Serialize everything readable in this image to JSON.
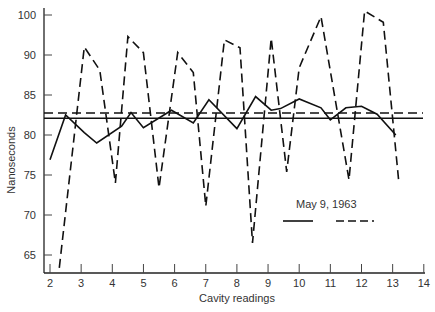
{
  "chart_data": {
    "type": "line",
    "title": "",
    "xlabel": "Cavity readings",
    "ylabel": "Nanoseconds",
    "xlim": [
      2,
      14
    ],
    "ylim": [
      62.5,
      97
    ],
    "grid": false,
    "x_ticks": [
      "2",
      "3",
      "4",
      "5",
      "6",
      "7",
      "8",
      "9",
      "10",
      "11",
      "12",
      "13",
      "14"
    ],
    "y_ticks": [
      {
        "label": "100",
        "pos": 95
      },
      {
        "label": "90",
        "pos": 90
      },
      {
        "label": "85",
        "pos": 85
      },
      {
        "label": "80",
        "pos": 80
      },
      {
        "label": "75",
        "pos": 75
      },
      {
        "label": "70",
        "pos": 70
      },
      {
        "label": "65",
        "pos": 65
      }
    ],
    "legend": {
      "title": "May 9, 1963",
      "position": "lower right",
      "entries": [
        {
          "name": "solid",
          "style": "solid"
        },
        {
          "name": "dashed",
          "style": "dashed"
        }
      ]
    },
    "series": [
      {
        "name": "solid",
        "style": "solid",
        "x": [
          2.0,
          2.5,
          3.1,
          3.5,
          4.3,
          4.6,
          5.0,
          5.9,
          6.6,
          7.1,
          8.0,
          8.6,
          9.1,
          9.4,
          10.0,
          10.7,
          11.0,
          11.5,
          12.0,
          12.5,
          13.1
        ],
        "y": [
          76.9,
          82.5,
          80.3,
          79.0,
          81.1,
          82.8,
          80.9,
          83.1,
          81.5,
          84.4,
          80.8,
          84.8,
          83.1,
          83.3,
          84.5,
          83.4,
          81.9,
          83.4,
          83.6,
          82.6,
          80.0
        ],
        "mean": 82.1
      },
      {
        "name": "dashed",
        "style": "dashed",
        "x": [
          2.3,
          3.1,
          3.6,
          4.1,
          4.5,
          5.0,
          5.5,
          6.1,
          6.6,
          7.0,
          7.6,
          8.1,
          8.5,
          9.1,
          9.6,
          10.0,
          10.7,
          11.6,
          12.1,
          12.7,
          13.2
        ],
        "y": [
          63.4,
          91.0,
          88.1,
          74.0,
          92.3,
          90.3,
          73.4,
          90.3,
          87.8,
          71.1,
          91.9,
          90.9,
          66.5,
          92.1,
          75.4,
          88.4,
          94.8,
          74.4,
          95.5,
          94.1,
          74.0
        ],
        "mean": 82.75
      }
    ]
  }
}
